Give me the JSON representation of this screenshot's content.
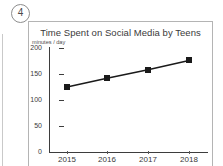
{
  "worksheet": {
    "question_number": "4"
  },
  "chart_data": {
    "type": "line",
    "title": "Time Spent on Social Media by Teens",
    "ylabel": "minutes / day",
    "xlabel": "",
    "categories": [
      "2015",
      "2016",
      "2017",
      "2018"
    ],
    "values": [
      125,
      142,
      158,
      176
    ],
    "series": [
      {
        "name": "minutes / day",
        "values": [
          125,
          142,
          158,
          176
        ]
      }
    ],
    "ylim": [
      0,
      200
    ],
    "y_ticks": [
      "200",
      "150",
      "100",
      "50",
      "0"
    ],
    "y_tick_values": [
      200,
      150,
      100,
      50,
      0
    ],
    "grid": false,
    "legend": "none",
    "marker": "filled-square",
    "line_color": "#1a1a1a",
    "marker_color": "#1a1a1a"
  }
}
